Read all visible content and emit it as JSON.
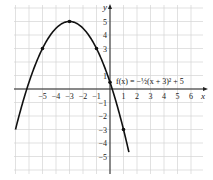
{
  "chart_data": {
    "type": "line",
    "title": "",
    "function_label": "f(x) = −½(x + 3)² + 5",
    "xlabel": "x",
    "ylabel": "y",
    "xlim": [
      -7,
      7
    ],
    "ylim": [
      -6,
      6
    ],
    "grid": true,
    "x_ticks": [
      -5,
      -4,
      -3,
      -2,
      -1,
      1,
      2,
      3,
      4,
      5,
      6
    ],
    "y_ticks": [
      -5,
      -4,
      -3,
      -2,
      -1,
      1,
      3,
      4,
      5
    ],
    "x_tick_labels": [
      "−5",
      "−4",
      "−3",
      "−2",
      "−1",
      "1",
      "2",
      "3",
      "4",
      "5",
      "6"
    ],
    "y_tick_labels": [
      "−5",
      "−4",
      "−3",
      "−2",
      "−1",
      "1",
      "3",
      "4",
      "5"
    ],
    "marked_points": [
      {
        "x": -5,
        "y": 3
      },
      {
        "x": -3,
        "y": 5
      },
      {
        "x": -1,
        "y": 3
      },
      {
        "x": 0,
        "y": 0.5
      },
      {
        "x": 1,
        "y": -3
      }
    ],
    "series": [
      {
        "name": "f(x) = −½(x + 3)² + 5",
        "x": [
          -7,
          -6,
          -5,
          -4,
          -3,
          -2,
          -1,
          0,
          1,
          1.4
        ],
        "values": [
          -3,
          0.5,
          3,
          4.5,
          5,
          4.5,
          3,
          0.5,
          -3,
          -4.68
        ]
      }
    ]
  }
}
